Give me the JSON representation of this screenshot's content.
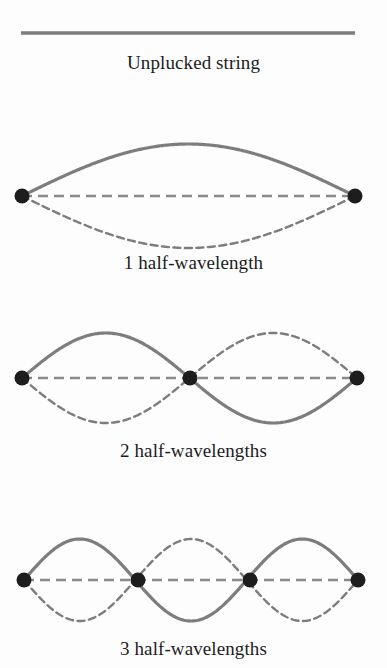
{
  "figure": {
    "background_color": "#fdfdfd",
    "width": 387,
    "height": 668
  },
  "style": {
    "string_color": "#7d7d7d",
    "node_color": "#1d1d1d",
    "axis_color": "#8a8a8a",
    "caption_color": "#1c1c1c",
    "solid_width": 3.2,
    "dashed_width": 2.4,
    "axis_width": 2.6,
    "node_radius": 7.5,
    "curve_dash_pattern": "7 4.5",
    "axis_dash_pattern": "10 6"
  },
  "panels": [
    {
      "id": "unplucked",
      "caption": "Unplucked string",
      "type": "straight-string",
      "half_wavelengths": 0,
      "nodes": 0,
      "line": {
        "x1": 21,
        "y1": 33,
        "x2": 355,
        "y2": 33
      },
      "has_dashed_mirror": false
    },
    {
      "id": "mode-1",
      "caption": "1 half-wavelength",
      "type": "standing-wave",
      "half_wavelengths": 1,
      "harmonic": 1,
      "nodes": 2,
      "node_x": [
        22,
        355
      ],
      "baseline_y": 86,
      "amplitude": 52,
      "has_dashed_mirror": true
    },
    {
      "id": "mode-2",
      "caption": "2 half-wavelengths",
      "type": "standing-wave",
      "half_wavelengths": 2,
      "harmonic": 2,
      "nodes": 3,
      "node_x": [
        22,
        190,
        357
      ],
      "baseline_y": 100,
      "amplitude": 45,
      "has_dashed_mirror": true
    },
    {
      "id": "mode-3",
      "caption": "3 half-wavelengths",
      "type": "standing-wave",
      "half_wavelengths": 3,
      "harmonic": 3,
      "nodes": 4,
      "node_x": [
        24,
        138,
        250,
        358
      ],
      "baseline_y": 110,
      "amplitude": 41,
      "has_dashed_mirror": true
    }
  ]
}
